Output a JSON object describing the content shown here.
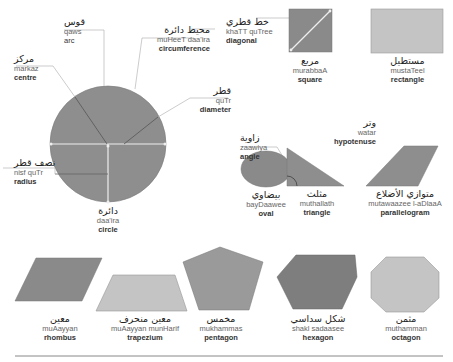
{
  "colors": {
    "dark_shape": "#8a8a8a",
    "mid_shape": "#9a9a9a",
    "light_shape": "#c4c4c4",
    "leader_line": "#aaaaaa",
    "white_line": "#eeeeee"
  },
  "circle_parts": {
    "arc": {
      "arabic": "قوس",
      "translit": "qaws",
      "english": "arc"
    },
    "circumference": {
      "arabic": "محيط دائرة",
      "translit": "muHeeT daa'ira",
      "english": "circumference"
    },
    "centre": {
      "arabic": "مركز",
      "translit": "markaz",
      "english": "centre"
    },
    "diameter": {
      "arabic": "قطر",
      "translit": "quTr",
      "english": "diameter"
    },
    "radius": {
      "arabic": "نصف قطر",
      "translit": "nisf quTr",
      "english": "radius"
    },
    "circle": {
      "arabic": "دائرة",
      "translit": "daa'ira",
      "english": "circle"
    }
  },
  "diagonal": {
    "arabic": "خط قطري",
    "translit": "khaTT quTree",
    "english": "diagonal"
  },
  "square": {
    "arabic": "مربع",
    "translit": "murabbaA",
    "english": "square"
  },
  "rectangle": {
    "arabic": "مستطيل",
    "translit": "mustaTeel",
    "english": "rectangle"
  },
  "oval": {
    "arabic": "بيضاوي",
    "translit": "bayDaawee",
    "english": "oval"
  },
  "angle": {
    "arabic": "زاوية",
    "translit": "zaawiya",
    "english": "angle"
  },
  "hypotenuse": {
    "arabic": "وتر",
    "translit": "watar",
    "english": "hypotenuse"
  },
  "triangle": {
    "arabic": "مثلث",
    "translit": "muthallath",
    "english": "triangle"
  },
  "parallelogram": {
    "arabic": "متوازي الأضلاع",
    "translit": "mutawaazee l-aDlaaA",
    "english": "parallelogram"
  },
  "rhombus": {
    "arabic": "معين",
    "translit": "muAayyan",
    "english": "rhombus"
  },
  "trapezium": {
    "arabic": "معين منحرف",
    "translit": "muAayyan munHarif",
    "english": "trapezium"
  },
  "pentagon": {
    "arabic": "مخمس",
    "translit": "mukhammas",
    "english": "pentagon"
  },
  "hexagon": {
    "arabic": "شكل سداسي",
    "translit": "shakl sadaasee",
    "english": "hexagon"
  },
  "octagon": {
    "arabic": "مثمن",
    "translit": "muthamman",
    "english": "octagon"
  }
}
